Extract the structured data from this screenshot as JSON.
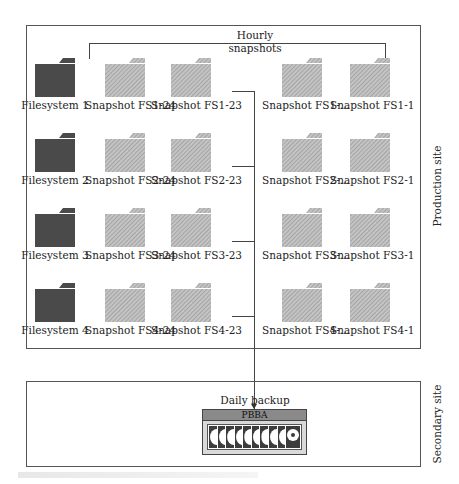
{
  "diagram": {
    "production_site": {
      "label": "Production site",
      "bracket_label_line1": "Hourly",
      "bracket_label_line2": "snapshots",
      "rows": [
        {
          "filesystem": "Filesystem 1",
          "snapshots": [
            "Snapshot FS1-24",
            "Snapshot FS1-23",
            "Snapshot FS1-...",
            "Snapshot FS1-1"
          ]
        },
        {
          "filesystem": "Filesystem 2",
          "snapshots": [
            "Snapshot FS2-24",
            "Snapshot FS2-23",
            "Snapshot FS2-...",
            "Snapshot FS2-1"
          ]
        },
        {
          "filesystem": "Filesystem 3",
          "snapshots": [
            "Snapshot FS3-24",
            "Snapshot FS3-23",
            "Snapshot FS3-...",
            "Snapshot FS3-1"
          ]
        },
        {
          "filesystem": "Filesystem 4",
          "snapshots": [
            "Snapshot FS4-24",
            "Snapshot FS4-23",
            "Snapshot FS4-...",
            "Snapshot FS4-1"
          ]
        }
      ]
    },
    "secondary_site": {
      "label": "Secondary site",
      "arrow_label": "Daily backup",
      "device_label": "PBBA",
      "disk_count": 9
    },
    "colors": {
      "filesystem_folder": "#4a4a4a",
      "snapshot_folder": "#b5b5b5",
      "border": "#555555"
    }
  }
}
